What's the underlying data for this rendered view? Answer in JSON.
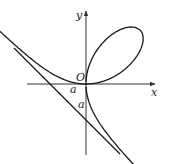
{
  "figure": {
    "type": "folium-of-descartes",
    "equation": "x^3 + y^3 = 3axy",
    "asymptote": "x + y + a = 0",
    "labels": {
      "x_axis": "x",
      "y_axis": "y",
      "origin": "O",
      "x_intercept": "a",
      "y_intercept": "a"
    },
    "colors": {
      "stroke": "#1a1a1a",
      "background": "#ffffff"
    }
  }
}
